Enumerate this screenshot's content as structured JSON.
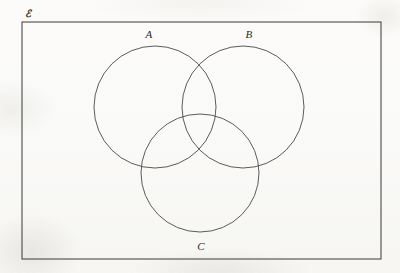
{
  "figure": {
    "kind": "venn-diagram",
    "set_count": 3,
    "background_color": "#fbfaf8",
    "stroke_color": "#4a4a4a",
    "label_color": "#2b2b2b",
    "universe": {
      "label": "ℰ",
      "label_x": 28,
      "label_y": 14,
      "rect": {
        "x": 22,
        "y": 22,
        "width": 359,
        "height": 237
      },
      "stroke_width": 1.1
    },
    "circles": [
      {
        "name": "A",
        "label": "A",
        "cx": 155,
        "cy": 107,
        "r": 61,
        "label_x": 149,
        "label_y": 34,
        "stroke_width": 0.9
      },
      {
        "name": "B",
        "label": "B",
        "cx": 243,
        "cy": 107,
        "r": 61,
        "label_x": 249,
        "label_y": 34,
        "stroke_width": 0.9
      },
      {
        "name": "C",
        "label": "C",
        "cx": 200,
        "cy": 173,
        "r": 59,
        "label_x": 201,
        "label_y": 246,
        "stroke_width": 0.9
      }
    ]
  }
}
